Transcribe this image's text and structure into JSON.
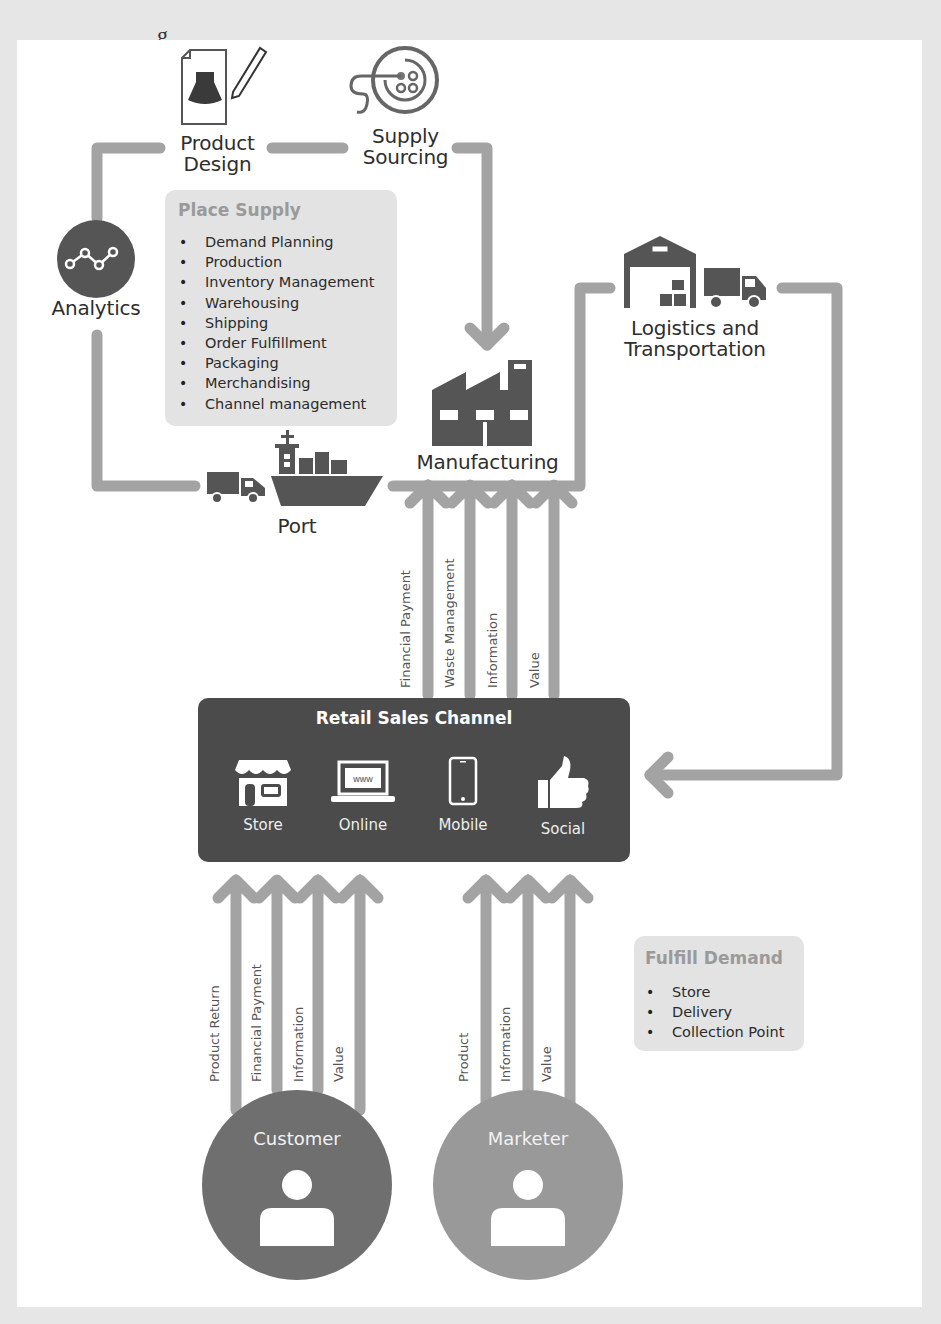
{
  "header": {
    "cut_title_fragment": "g"
  },
  "nodes": {
    "product_design": {
      "label_line1": "Product",
      "label_line2": "Design",
      "icon": "dress-design-sheet-icon"
    },
    "supply_sourcing": {
      "label_line1": "Supply",
      "label_line2": "Sourcing",
      "icon": "button-thread-icon"
    },
    "analytics": {
      "label": "Analytics",
      "icon": "line-graph-icon"
    },
    "logistics": {
      "label_line1": "Logistics and",
      "label_line2": "Transportation",
      "icon": "warehouse-truck-icon"
    },
    "manufacturing": {
      "label": "Manufacturing",
      "icon": "factory-icon"
    },
    "port": {
      "label": "Port",
      "icon": "truck-ship-icon"
    }
  },
  "place_supply": {
    "title": "Place Supply",
    "items": [
      "Demand Planning",
      "Production",
      "Inventory Management",
      "Warehousing",
      "Shipping",
      "Order Fulfillment",
      "Packaging",
      "Merchandising",
      "Channel management"
    ]
  },
  "retail_to_manufacturing_flows": [
    "Financial Payment",
    "Waste Management",
    "Information",
    "Value"
  ],
  "retail": {
    "title": "Retail Sales Channel",
    "channels": [
      {
        "label": "Store",
        "icon": "storefront-icon"
      },
      {
        "label": "Online",
        "icon": "laptop-www-icon"
      },
      {
        "label": "Mobile",
        "icon": "smartphone-icon"
      },
      {
        "label": "Social",
        "icon": "thumbs-up-icon"
      }
    ]
  },
  "customer_flows": [
    "Product Return",
    "Financial Payment",
    "Information",
    "Value"
  ],
  "marketer_flows": [
    "Product",
    "Information",
    "Value"
  ],
  "fulfill_demand": {
    "title": "Fulfill Demand",
    "items": [
      "Store",
      "Delivery",
      "Collection Point"
    ]
  },
  "actors": {
    "customer": {
      "label": "Customer",
      "color": "#6f6f6f"
    },
    "marketer": {
      "label": "Marketer",
      "color": "#999999"
    }
  },
  "colors": {
    "connector": "#a3a3a3",
    "dark_icon": "#555555",
    "retail_bg": "#4b4b4b",
    "info_box_bg": "#e3e3e3"
  }
}
